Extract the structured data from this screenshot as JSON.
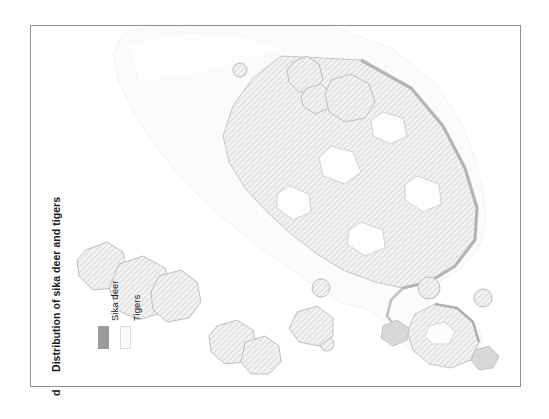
{
  "panel": {
    "letter": "d",
    "title": "Distribution of sika deer and tigers"
  },
  "legend": {
    "items": [
      {
        "label": "Sika deer",
        "swatch": "#9a9c9e",
        "border": "#9a9c9e",
        "icon": "legend-swatch-icon"
      },
      {
        "label": "Tigers",
        "swatch": "#fbfbfb",
        "border": "#dcdcdc",
        "icon": "legend-swatch-icon"
      }
    ]
  },
  "frame": {
    "border_color": "#8e9194",
    "background": "#ffffff"
  },
  "map": {
    "background": "#ffffff",
    "tiger_range_fill": "#fafafa",
    "tiger_range_stroke": "#f0f0f0",
    "land_fill": "#f7f7f7",
    "land_stroke": "#c9cbcd",
    "coast_shadow": "#b8babc",
    "deer_patch_fill": "#ededed",
    "deer_patch_stroke": "#b9bbbd",
    "hatch_color": "#c4c6c8",
    "region_label": "",
    "orientation": "northeast-southwest diagonal landmass"
  }
}
